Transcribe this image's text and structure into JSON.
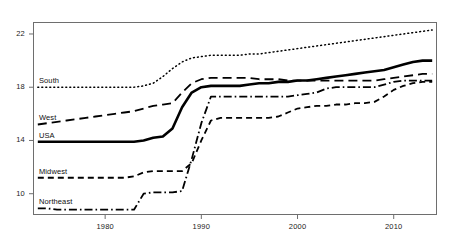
{
  "chart_data": {
    "type": "line",
    "title": "",
    "subtitle": "",
    "xlabel": "",
    "ylabel": "",
    "xlim": [
      1972.5,
      2014.5
    ],
    "ylim": [
      8.4,
      22.9
    ],
    "grid": false,
    "legend": "inline-labels-left",
    "xticks": [
      1980,
      1990,
      2000,
      2010
    ],
    "xtick_labels": [
      "1980",
      "1990",
      "2000",
      "2010"
    ],
    "yticks": [
      10,
      14,
      18,
      22
    ],
    "ytick_labels": [
      "10",
      "14",
      "18",
      "22"
    ],
    "x": [
      1973,
      1974,
      1975,
      1976,
      1977,
      1978,
      1979,
      1980,
      1981,
      1982,
      1983,
      1984,
      1985,
      1986,
      1987,
      1988,
      1989,
      1990,
      1991,
      1992,
      1993,
      1994,
      1995,
      1996,
      1997,
      1998,
      1999,
      2000,
      2001,
      2002,
      2003,
      2004,
      2005,
      2006,
      2007,
      2008,
      2009,
      2010,
      2011,
      2012,
      2013,
      2014
    ],
    "series": [
      {
        "name": "South",
        "style": "dotted",
        "values": [
          18.0,
          18.0,
          18.0,
          18.0,
          18.0,
          18.0,
          18.0,
          18.0,
          18.0,
          18.0,
          18.0,
          18.1,
          18.3,
          18.8,
          19.4,
          19.9,
          20.2,
          20.3,
          20.4,
          20.4,
          20.4,
          20.4,
          20.5,
          20.5,
          20.6,
          20.7,
          20.8,
          20.9,
          21.0,
          21.1,
          21.2,
          21.3,
          21.4,
          21.5,
          21.6,
          21.7,
          21.8,
          21.9,
          22.0,
          22.1,
          22.2,
          22.3
        ]
      },
      {
        "name": "West",
        "style": "dashed-long",
        "values": [
          15.2,
          15.3,
          15.4,
          15.5,
          15.6,
          15.7,
          15.8,
          15.9,
          16.0,
          16.1,
          16.2,
          16.4,
          16.6,
          16.7,
          16.8,
          17.6,
          18.3,
          18.6,
          18.7,
          18.7,
          18.7,
          18.7,
          18.7,
          18.6,
          18.6,
          18.6,
          18.5,
          18.5,
          18.5,
          18.5,
          18.5,
          18.5,
          18.5,
          18.5,
          18.5,
          18.5,
          18.6,
          18.7,
          18.8,
          18.9,
          19.0,
          19.0
        ]
      },
      {
        "name": "USA",
        "style": "solid-thick",
        "values": [
          13.9,
          13.9,
          13.9,
          13.9,
          13.9,
          13.9,
          13.9,
          13.9,
          13.9,
          13.9,
          13.9,
          14.0,
          14.2,
          14.3,
          14.9,
          16.5,
          17.6,
          18.0,
          18.1,
          18.1,
          18.1,
          18.1,
          18.2,
          18.3,
          18.3,
          18.4,
          18.4,
          18.5,
          18.5,
          18.6,
          18.7,
          18.8,
          18.9,
          19.0,
          19.1,
          19.2,
          19.3,
          19.5,
          19.7,
          19.9,
          20.0,
          20.0
        ]
      },
      {
        "name": "Midwest",
        "style": "dashed-short",
        "values": [
          11.2,
          11.2,
          11.2,
          11.2,
          11.2,
          11.2,
          11.2,
          11.2,
          11.2,
          11.2,
          11.3,
          11.6,
          11.7,
          11.7,
          11.7,
          11.7,
          12.3,
          14.0,
          15.5,
          15.7,
          15.7,
          15.7,
          15.7,
          15.7,
          15.7,
          15.8,
          16.1,
          16.4,
          16.5,
          16.6,
          16.6,
          16.7,
          16.7,
          16.8,
          16.8,
          16.9,
          17.3,
          17.8,
          18.1,
          18.3,
          18.4,
          18.4
        ]
      },
      {
        "name": "Northeast",
        "style": "dash-dot",
        "values": [
          8.9,
          8.9,
          8.8,
          8.8,
          8.8,
          8.8,
          8.8,
          8.8,
          8.8,
          8.8,
          8.8,
          10.0,
          10.1,
          10.1,
          10.1,
          10.2,
          12.6,
          15.3,
          17.3,
          17.3,
          17.3,
          17.3,
          17.3,
          17.3,
          17.3,
          17.3,
          17.3,
          17.4,
          17.5,
          17.6,
          17.9,
          18.0,
          18.0,
          18.0,
          18.0,
          18.0,
          18.2,
          18.4,
          18.5,
          18.5,
          18.5,
          18.5
        ]
      }
    ],
    "series_labels": [
      {
        "name": "South",
        "text": "South"
      },
      {
        "name": "West",
        "text": "West"
      },
      {
        "name": "USA",
        "text": "USA"
      },
      {
        "name": "Midwest",
        "text": "Midwest"
      },
      {
        "name": "Northeast",
        "text": "Northeast"
      }
    ],
    "colors": {
      "line": "#000000",
      "axis": "#6e6e6e",
      "text": "#111111",
      "background": "#ffffff"
    }
  }
}
